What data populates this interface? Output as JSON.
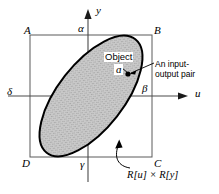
{
  "figure": {
    "name": "object-input-output-product-space-diagram",
    "background_color": "#ffffff",
    "line_color": "#000000",
    "shade_color": "#b5b5b5"
  },
  "axes": {
    "horizontal_label": "u",
    "vertical_label": "y",
    "origin_x": 88,
    "origin_y": 96
  },
  "corners": {
    "top_left": "A",
    "top_right": "B",
    "bottom_right": "C",
    "bottom_left": "D"
  },
  "bounds": {
    "top": "α",
    "right": "β",
    "bottom": "γ",
    "left": "δ"
  },
  "annotations": {
    "object_title": "Object",
    "object_symbol": "ɑ",
    "pair_line1": "An input-",
    "pair_line2": "output pair",
    "product_space": "R[u] × R[y]"
  },
  "geometry": {
    "rectangle": {
      "x": 30,
      "y": 35,
      "width": 122,
      "height": 122
    },
    "ellipse": {
      "cx": 91,
      "cy": 96,
      "rx": 72,
      "ry": 33,
      "rotation": -52
    },
    "point": {
      "x": 128,
      "y": 74
    }
  }
}
